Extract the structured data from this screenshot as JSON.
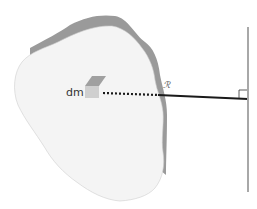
{
  "figure": {
    "mass_element_label": "dm",
    "distance_label": "ℛ",
    "colors": {
      "body_fill": "#f4f4f4",
      "body_shadow": "#9a9a9a",
      "axis_line": "#a8a8a8",
      "distance_line": "#1a1a1a",
      "cube_top": "#a0a0a0",
      "cube_front": "#cfcfcf"
    }
  }
}
